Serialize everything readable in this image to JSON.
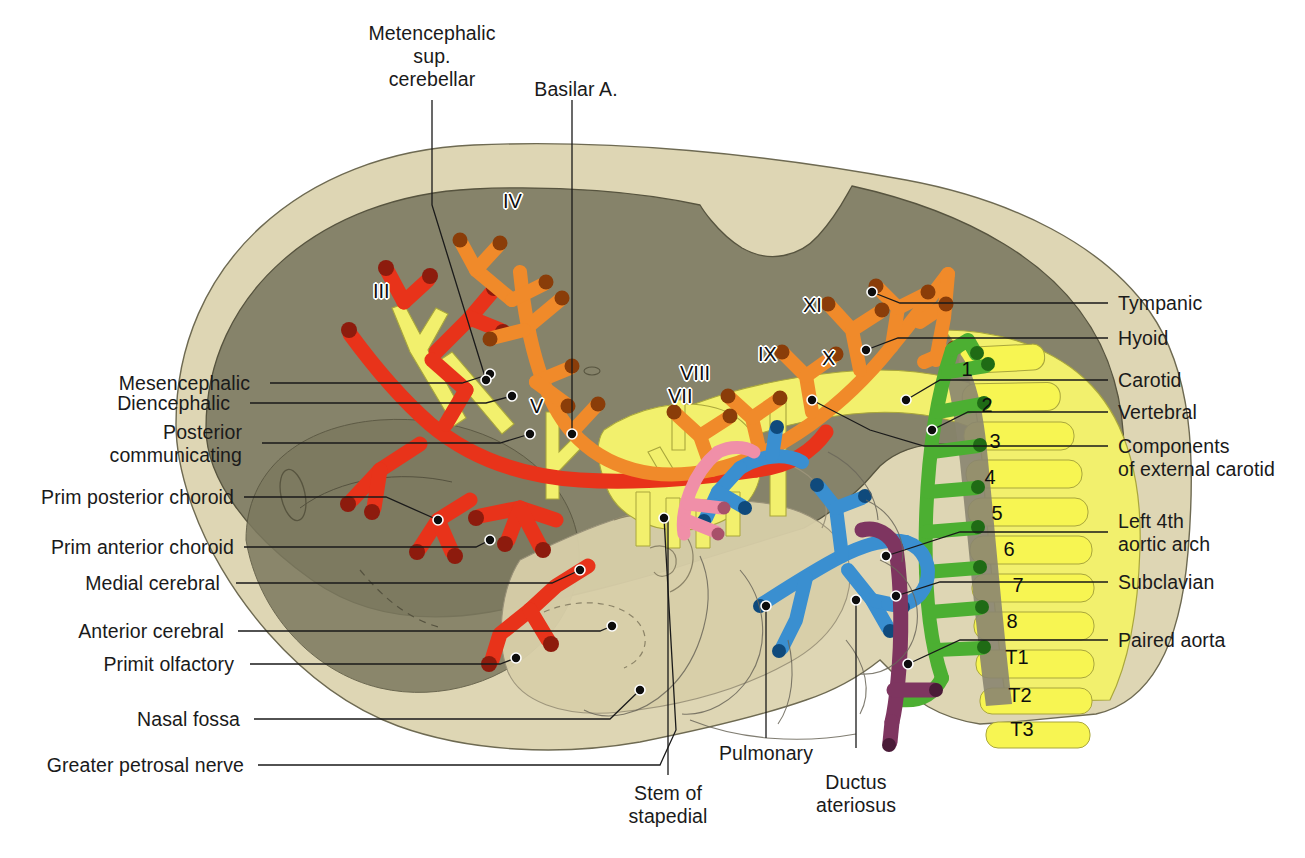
{
  "figure": {
    "background": "#ffffff"
  },
  "palette": {
    "head_outer": "#ded6b4",
    "brain_gray": "#86836a",
    "brain_gray_dark": "#7c795f",
    "red_artery": "#e8331a",
    "red_artery_dark": "#8d1b0d",
    "orange_artery": "#f08a2a",
    "orange_artery_dark": "#8a3d09",
    "yellow_nerve": "#f2f06d",
    "green_artery": "#4caf32",
    "blue_pulmonary": "#3a8fd0",
    "purple_ductus": "#7e3560",
    "pink_stapedial": "#f08fa8",
    "outline": "#3a3a32",
    "leader_line": "#1a1a1a"
  },
  "labels_left": [
    {
      "id": "mesencephalic",
      "text": "Mesencephalic"
    },
    {
      "id": "diencephalic",
      "text": "Diencephalic"
    },
    {
      "id": "posterior-communicating",
      "text": "Posterior\ncommunicating"
    },
    {
      "id": "prim-posterior-choroid",
      "text": "Prim posterior choroid"
    },
    {
      "id": "prim-anterior-choroid",
      "text": "Prim anterior choroid"
    },
    {
      "id": "medial-cerebral",
      "text": "Medial cerebral"
    },
    {
      "id": "anterior-cerebral",
      "text": "Anterior cerebral"
    },
    {
      "id": "primit-olfactory",
      "text": "Primit olfactory"
    },
    {
      "id": "nasal-fossa",
      "text": "Nasal fossa"
    },
    {
      "id": "greater-petrosal-nerve",
      "text": "Greater petrosal nerve"
    }
  ],
  "labels_right": [
    {
      "id": "tympanic",
      "text": "Tympanic"
    },
    {
      "id": "hyoid",
      "text": "Hyoid"
    },
    {
      "id": "carotid",
      "text": "Carotid"
    },
    {
      "id": "vertebral",
      "text": "Vertebral"
    },
    {
      "id": "components-of-external-carotid",
      "text": "Components\nof external carotid"
    },
    {
      "id": "left-4th-aortic-arch",
      "text": "Left 4th\naortic arch"
    },
    {
      "id": "subclavian",
      "text": "Subclavian"
    },
    {
      "id": "paired-aorta",
      "text": "Paired aorta"
    }
  ],
  "labels_top": [
    {
      "id": "metencephalic-sup-cerebellar",
      "text": "Metencephalic\nsup.\ncerebellar"
    },
    {
      "id": "basilar-a",
      "text": "Basilar A."
    }
  ],
  "labels_bottom": [
    {
      "id": "stem-of-stapedial",
      "text": "Stem of\nstapedial"
    },
    {
      "id": "pulmonary",
      "text": "Pulmonary"
    },
    {
      "id": "ductus-ateriosus",
      "text": "Ductus\nateriosus"
    }
  ],
  "cranial_nerves": [
    {
      "id": "iii",
      "text": "III"
    },
    {
      "id": "iv",
      "text": "IV"
    },
    {
      "id": "v",
      "text": "V"
    },
    {
      "id": "vii",
      "text": "VII"
    },
    {
      "id": "viii",
      "text": "VIII"
    },
    {
      "id": "ix",
      "text": "IX"
    },
    {
      "id": "x",
      "text": "X"
    },
    {
      "id": "xi",
      "text": "XI"
    }
  ],
  "vertebrae": [
    {
      "id": "c1",
      "text": "1"
    },
    {
      "id": "c2",
      "text": "2"
    },
    {
      "id": "c3",
      "text": "3"
    },
    {
      "id": "c4",
      "text": "4"
    },
    {
      "id": "c5",
      "text": "5"
    },
    {
      "id": "c6",
      "text": "6"
    },
    {
      "id": "c7",
      "text": "7"
    },
    {
      "id": "c8",
      "text": "8"
    },
    {
      "id": "t1",
      "text": "T1"
    },
    {
      "id": "t2",
      "text": "T2"
    },
    {
      "id": "t3",
      "text": "T3"
    }
  ]
}
